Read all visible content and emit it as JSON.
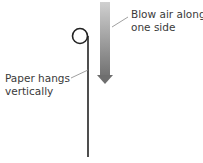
{
  "diagram": {
    "labels": {
      "air": [
        "Blow air along",
        "one side"
      ],
      "paper": [
        "Paper hangs",
        "vertically"
      ]
    },
    "colors": {
      "line": "#222222",
      "arrow_top": "#c8c8c8",
      "arrow_bottom": "#7a7a7a",
      "leader": "#888888",
      "text": "#3a3a3a"
    }
  }
}
